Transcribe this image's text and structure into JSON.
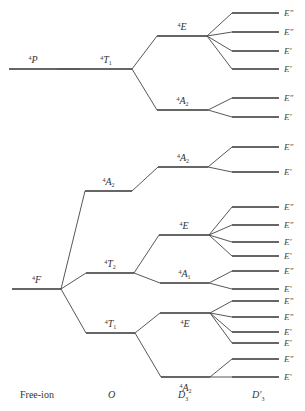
{
  "diagram": {
    "columns": [
      {
        "id": "free-ion",
        "label": "Free-ion",
        "x": 20
      },
      {
        "id": "O",
        "label": "O",
        "x": 110
      },
      {
        "id": "D3",
        "label": "D",
        "sub": "3",
        "x": 178
      },
      {
        "id": "D3prime",
        "label": "D′",
        "sub": "3",
        "x": 253
      }
    ],
    "free_ion_terms": [
      {
        "id": "4P",
        "label": "P",
        "mult": "4",
        "y": 69,
        "x1": 9,
        "x2": 57
      },
      {
        "id": "4F",
        "label": "F",
        "mult": "4",
        "y": 289,
        "x1": 12,
        "x2": 61
      }
    ],
    "O_terms": [
      {
        "id": "4T1a",
        "label": "T",
        "mult": "4",
        "sub": "1",
        "y": 69,
        "x1": 80,
        "x2": 132,
        "parent": "4P"
      },
      {
        "id": "4A2o",
        "label": "A",
        "mult": "4",
        "sub": "2",
        "y": 191,
        "x1": 85,
        "x2": 132,
        "parent": "4F"
      },
      {
        "id": "4T2",
        "label": "T",
        "mult": "4",
        "sub": "2",
        "y": 273,
        "x1": 86,
        "x2": 134,
        "parent": "4F"
      },
      {
        "id": "4T1b",
        "label": "T",
        "mult": "4",
        "sub": "1",
        "y": 333,
        "x1": 86,
        "x2": 135,
        "parent": "4F"
      }
    ],
    "D3_terms": [
      {
        "id": "E1",
        "label": "E",
        "mult": "4",
        "y": 36,
        "x1": 157,
        "x2": 207,
        "parent": "4T1a",
        "label_pos": "above"
      },
      {
        "id": "A2a",
        "label": "A",
        "mult": "4",
        "sub": "2",
        "y": 110,
        "x1": 157,
        "x2": 208,
        "parent": "4T1a",
        "label_pos": "above"
      },
      {
        "id": "A2b",
        "label": "A",
        "mult": "4",
        "sub": "2",
        "y": 167,
        "x1": 158,
        "x2": 208,
        "parent": "4A2o",
        "label_pos": "above"
      },
      {
        "id": "E2",
        "label": "E",
        "mult": "4",
        "y": 235,
        "x1": 159,
        "x2": 209,
        "parent": "4T2",
        "label_pos": "above"
      },
      {
        "id": "A1",
        "label": "A",
        "mult": "4",
        "sub": "1",
        "y": 283,
        "x1": 160,
        "x2": 209,
        "parent": "4T2",
        "label_pos": "above"
      },
      {
        "id": "E3",
        "label": "E",
        "mult": "4",
        "y": 313,
        "x1": 160,
        "x2": 210,
        "parent": "4T1b",
        "label_pos": "below"
      },
      {
        "id": "A2c",
        "label": "A",
        "mult": "4",
        "sub": "2",
        "y": 377,
        "x1": 161,
        "x2": 210,
        "parent": "4T1b",
        "label_pos": "below"
      }
    ],
    "D3prime_levels": [
      {
        "label": "E″",
        "y": 13,
        "parent": "E1"
      },
      {
        "label": "E″",
        "y": 32,
        "parent": "E1"
      },
      {
        "label": "E′",
        "y": 51,
        "parent": "E1"
      },
      {
        "label": "E′",
        "y": 69,
        "parent": "E1"
      },
      {
        "label": "E″",
        "y": 98,
        "parent": "A2a"
      },
      {
        "label": "E′",
        "y": 117,
        "parent": "A2a"
      },
      {
        "label": "E″",
        "y": 147,
        "parent": "A2b"
      },
      {
        "label": "E′",
        "y": 172,
        "parent": "A2b"
      },
      {
        "label": "E″",
        "y": 207,
        "parent": "E2"
      },
      {
        "label": "E″",
        "y": 225,
        "parent": "E2"
      },
      {
        "label": "E′",
        "y": 242,
        "parent": "E2"
      },
      {
        "label": "E′",
        "y": 256,
        "parent": "E2"
      },
      {
        "label": "E″",
        "y": 271,
        "parent": "A1"
      },
      {
        "label": "E′",
        "y": 289,
        "parent": "A1"
      },
      {
        "label": "E″",
        "y": 301,
        "parent": "E3"
      },
      {
        "label": "E″",
        "y": 317,
        "parent": "E3"
      },
      {
        "label": "E′",
        "y": 332,
        "parent": "E3"
      },
      {
        "label": "E′",
        "y": 343,
        "parent": "E3"
      },
      {
        "label": "E″",
        "y": 359,
        "parent": "A2c"
      },
      {
        "label": "E′",
        "y": 377,
        "parent": "A2c"
      }
    ],
    "D3prime_x1": 232,
    "D3prime_x2": 279,
    "D3prime_label_x": 284
  },
  "axis_labels": {
    "free_ion": "Free-ion",
    "O": "O",
    "D3": "D",
    "D3_sub": "3",
    "D3prime": "D′",
    "D3prime_sub": "3"
  }
}
